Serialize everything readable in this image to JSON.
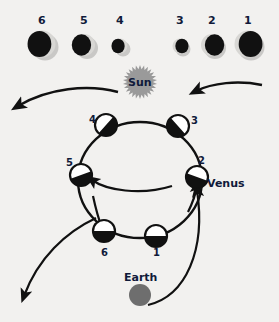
{
  "diagram": {
    "background_color": "#f2f1ef",
    "ink_color": "#111111",
    "label_color": "#101a3a",
    "sun_color": "#9a9a9a",
    "earth_color": "#6e6e6e",
    "shadow_color": "#c9c8c6"
  },
  "sun": {
    "label": "Sun",
    "cx": 140,
    "cy": 82,
    "r": 16
  },
  "earth": {
    "label": "Earth",
    "cx": 140,
    "cy": 295,
    "r": 11,
    "label_x": 124,
    "label_y": 272
  },
  "venus_label": {
    "text": "Venus",
    "x": 207,
    "y": 178
  },
  "phase_row": {
    "caption": "Apparent size and phase of Venus seen from Earth",
    "disks": [
      {
        "label": "6",
        "cx": 42,
        "cy": 44,
        "r": 13.5,
        "lit_side": "right",
        "lit_fraction": 0.22,
        "num_x": 38,
        "num_y": 15
      },
      {
        "label": "5",
        "cx": 84,
        "cy": 45,
        "r": 11,
        "lit_side": "right",
        "lit_fraction": 0.16,
        "num_x": 80,
        "num_y": 15
      },
      {
        "label": "4",
        "cx": 120,
        "cy": 46,
        "r": 7.5,
        "lit_side": "right",
        "lit_fraction": 0.12,
        "num_x": 116,
        "num_y": 15
      },
      {
        "label": "3",
        "cx": 180,
        "cy": 46,
        "r": 7.5,
        "lit_side": "left",
        "lit_fraction": 0.12,
        "num_x": 176,
        "num_y": 15
      },
      {
        "label": "2",
        "cx": 212,
        "cy": 45,
        "r": 11,
        "lit_side": "left",
        "lit_fraction": 0.16,
        "num_x": 208,
        "num_y": 15
      },
      {
        "label": "1",
        "cx": 248,
        "cy": 44,
        "r": 13.5,
        "lit_side": "left",
        "lit_fraction": 0.22,
        "num_x": 244,
        "num_y": 15
      }
    ]
  },
  "orbit": {
    "cx": 140,
    "cy": 180,
    "rx": 62,
    "ry": 58,
    "stroke_width": 2.4,
    "positions": [
      {
        "label": "1",
        "cx": 156,
        "cy": 236,
        "r": 11,
        "terminator_deg": 0,
        "dark_half": "bottom",
        "num_x": 153,
        "num_y": 248
      },
      {
        "label": "2",
        "cx": 197,
        "cy": 177,
        "r": 11,
        "terminator_deg": 20,
        "dark_half": "bottom",
        "num_x": 198,
        "num_y": 156
      },
      {
        "label": "3",
        "cx": 178,
        "cy": 126,
        "r": 11,
        "terminator_deg": 48,
        "dark_half": "bottom",
        "num_x": 191,
        "num_y": 116
      },
      {
        "label": "4",
        "cx": 106,
        "cy": 125,
        "r": 11,
        "terminator_deg": -48,
        "dark_half": "bottom",
        "num_x": 89,
        "num_y": 115
      },
      {
        "label": "5",
        "cx": 81,
        "cy": 175,
        "r": 11,
        "terminator_deg": -20,
        "dark_half": "bottom",
        "num_x": 66,
        "num_y": 158
      },
      {
        "label": "6",
        "cx": 104,
        "cy": 231,
        "r": 11,
        "terminator_deg": 0,
        "dark_half": "bottom",
        "num_x": 101,
        "num_y": 248
      }
    ]
  },
  "arrows": {
    "top_left": {
      "name": "sunlight-ray-top-left",
      "direction": "left"
    },
    "top_right": {
      "name": "sunlight-ray-top-right",
      "direction": "left"
    },
    "outer_left": {
      "name": "line-of-sight-left",
      "direction": "down-left"
    },
    "outer_right": {
      "name": "line-of-sight-right",
      "direction": "up-left"
    },
    "orbit_dir_2": {
      "name": "orbit-direction-arrow-upper",
      "direction": "up"
    },
    "orbit_dir_5": {
      "name": "orbit-direction-arrow-left",
      "direction": "left"
    },
    "orbit_dir_6": {
      "name": "orbit-direction-arrow-lower",
      "direction": "down"
    }
  }
}
